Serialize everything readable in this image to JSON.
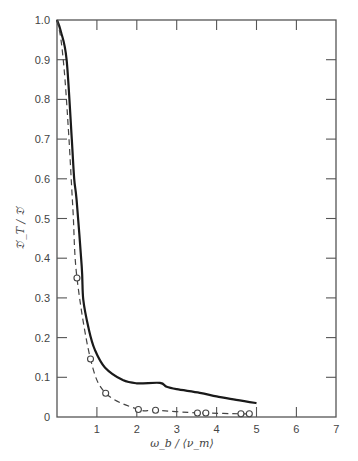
{
  "chart_data": {
    "type": "line",
    "title": "",
    "xlabel": "ω_b / ⟨ν_m⟩",
    "ylabel": "𝔇′_T / 𝔇′",
    "xlim": [
      0,
      7
    ],
    "ylim": [
      0,
      1.0
    ],
    "x_ticks": [
      1,
      2,
      3,
      4,
      5,
      6,
      7
    ],
    "y_ticks": [
      0,
      0.1,
      0.2,
      0.3,
      0.4,
      0.5,
      0.6,
      0.7,
      0.8,
      0.9,
      1.0
    ],
    "x_tick_labels": [
      "1",
      "2",
      "3",
      "4",
      "5",
      "6",
      "7"
    ],
    "y_tick_labels": [
      "0",
      "0.1",
      "0.2",
      "0.3",
      "0.4",
      "0.5",
      "0.6",
      "0.7",
      "0.8",
      "0.9",
      "1.0"
    ],
    "grid": false,
    "legend": null,
    "series": [
      {
        "name": "theory (solid)",
        "style": "solid",
        "x": [
          0.0,
          0.1,
          0.24,
          0.37,
          0.43,
          0.49,
          0.62,
          0.66,
          0.8,
          0.95,
          1.2,
          1.65,
          2.0,
          2.58,
          2.75,
          3.0,
          3.58,
          4.0,
          4.49,
          5.0
        ],
        "y": [
          1.0,
          0.97,
          0.9,
          0.7,
          0.6,
          0.547,
          0.38,
          0.295,
          0.22,
          0.169,
          0.125,
          0.093,
          0.085,
          0.086,
          0.076,
          0.07,
          0.061,
          0.052,
          0.043,
          0.035
        ]
      },
      {
        "name": "measured (dashed, circles)",
        "style": "dashed",
        "x": [
          0.0,
          0.1,
          0.2,
          0.3,
          0.4,
          0.5,
          0.84,
          1.22,
          2.04,
          2.47,
          3.52,
          3.73,
          4.61,
          4.82
        ],
        "y": [
          1.0,
          0.95,
          0.85,
          0.7,
          0.52,
          0.35,
          0.146,
          0.06,
          0.019,
          0.017,
          0.01,
          0.01,
          0.008,
          0.008
        ],
        "markers": [
          {
            "x": 0.5,
            "y": 0.35
          },
          {
            "x": 0.84,
            "y": 0.146
          },
          {
            "x": 1.22,
            "y": 0.06
          },
          {
            "x": 2.04,
            "y": 0.019
          },
          {
            "x": 2.47,
            "y": 0.017
          },
          {
            "x": 3.52,
            "y": 0.01
          },
          {
            "x": 3.73,
            "y": 0.01
          },
          {
            "x": 4.61,
            "y": 0.008
          },
          {
            "x": 4.82,
            "y": 0.008
          }
        ]
      }
    ]
  },
  "plot": {
    "x0_px": 57,
    "x_unit_px": 39.9,
    "y0_px": 417,
    "y_unit_px": 397
  }
}
